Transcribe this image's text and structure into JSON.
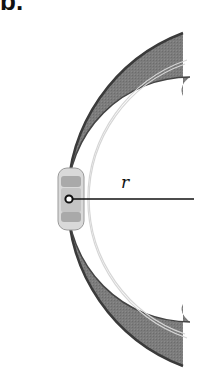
{
  "figure": {
    "part_label": "b.",
    "radius_label": "r"
  },
  "colors": {
    "road": "#7a7a7a",
    "road_edge": "#3a3a3a",
    "lane_line": "#d6d6d6",
    "car_body": "#cfcfcf",
    "car_window": "#a8a8a8",
    "radius_line": "#111111",
    "background": "#ffffff"
  }
}
